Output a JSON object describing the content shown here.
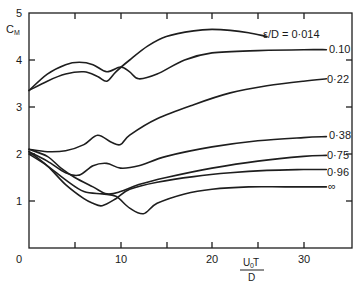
{
  "chart_data": {
    "type": "line",
    "title": "",
    "xlabel": "U0 T / D",
    "ylabel": "CM",
    "xlim": [
      0,
      35
    ],
    "ylim": [
      0,
      5
    ],
    "x_ticks": [
      0,
      10,
      20,
      30
    ],
    "x_minor_ticks": [
      5,
      15,
      25
    ],
    "y_ticks": [
      0,
      1,
      2,
      3,
      4,
      5
    ],
    "grid": false,
    "legend": "inline labels at right end of curves",
    "parameter": "ε/D",
    "series": [
      {
        "name": "ε/D = 0.014",
        "label": "ε/D = 0·014",
        "x": [
          0,
          2,
          4,
          6,
          7.5,
          8.5,
          9.5,
          11,
          13,
          15,
          18,
          20,
          22,
          24,
          26
        ],
        "y": [
          3.35,
          3.55,
          3.7,
          3.75,
          3.65,
          3.55,
          3.75,
          4.0,
          4.3,
          4.5,
          4.62,
          4.65,
          4.63,
          4.58,
          4.5
        ]
      },
      {
        "name": "ε/D = 0.10",
        "label": "0.10",
        "x": [
          0,
          2,
          4,
          5.5,
          7,
          8.5,
          10,
          11,
          12,
          14,
          17,
          20,
          25,
          30,
          32.5
        ],
        "y": [
          3.35,
          3.7,
          3.9,
          3.95,
          3.9,
          3.75,
          3.85,
          3.75,
          3.6,
          3.7,
          4.0,
          4.15,
          4.2,
          4.22,
          4.22
        ]
      },
      {
        "name": "ε/D = 0.22",
        "label": "0·22",
        "x": [
          0,
          2,
          4,
          6,
          7.5,
          9,
          10,
          11,
          14,
          18,
          22,
          26,
          30,
          32.5
        ],
        "y": [
          2.1,
          2.05,
          2.07,
          2.2,
          2.4,
          2.25,
          2.2,
          2.4,
          2.75,
          3.05,
          3.3,
          3.45,
          3.55,
          3.6
        ]
      },
      {
        "name": "ε/D = 0.38",
        "label": "0·38",
        "x": [
          0,
          2,
          4,
          5.5,
          7,
          8.5,
          10,
          12,
          15,
          20,
          25,
          30,
          32.5
        ],
        "y": [
          2.05,
          1.85,
          1.6,
          1.55,
          1.75,
          1.8,
          1.7,
          1.75,
          1.95,
          2.15,
          2.28,
          2.35,
          2.37
        ]
      },
      {
        "name": "ε/D = 0.75",
        "label": "0·75",
        "x": [
          0,
          2,
          3.5,
          5,
          7,
          8.5,
          10,
          12,
          15,
          20,
          25,
          30,
          32.5
        ],
        "y": [
          2.1,
          1.95,
          1.7,
          1.5,
          1.3,
          1.15,
          1.2,
          1.35,
          1.5,
          1.7,
          1.85,
          1.95,
          1.97
        ]
      },
      {
        "name": "ε/D = 0.96",
        "label": "0·96",
        "x": [
          0,
          2,
          4,
          6,
          7,
          8,
          9.5,
          11,
          14,
          18,
          22,
          26,
          30,
          32.5
        ],
        "y": [
          2.05,
          1.75,
          1.35,
          1.05,
          0.95,
          0.9,
          1.05,
          1.25,
          1.4,
          1.52,
          1.6,
          1.65,
          1.67,
          1.67
        ]
      },
      {
        "name": "ε/D = ∞",
        "label": "∞",
        "x": [
          0,
          2,
          4,
          6,
          8,
          9.5,
          11,
          12.5,
          14,
          17,
          20,
          24,
          28,
          32.5
        ],
        "y": [
          2.0,
          1.75,
          1.45,
          1.2,
          1.15,
          1.1,
          0.85,
          0.73,
          0.95,
          1.15,
          1.25,
          1.3,
          1.3,
          1.3
        ]
      }
    ]
  },
  "axes": {
    "y_label_main": "C",
    "y_label_sub": "M",
    "x_label_num_main": "U",
    "x_label_num_sub": "0",
    "x_label_num_tail": " T",
    "x_label_den": "D",
    "y_tick_labels": [
      "0",
      "1",
      "2",
      "3",
      "4",
      "5"
    ],
    "x_tick_labels": [
      "10",
      "20",
      "30"
    ]
  },
  "curve_labels": {
    "c0014": "ε/D = 0·014",
    "c010": "0.10",
    "c022": "0·22",
    "c038": "0·38",
    "c075": "0·75",
    "c096": "0·96",
    "cinf": "∞"
  }
}
